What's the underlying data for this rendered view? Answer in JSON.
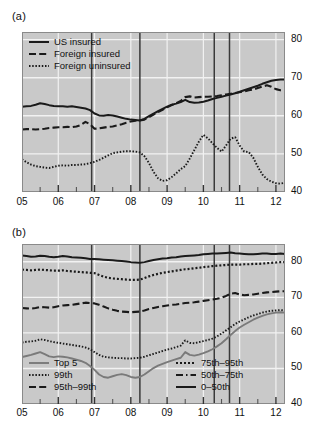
{
  "figure": {
    "width": 326,
    "height": 441,
    "background": "#ffffff",
    "plot_background": "#c9c9c9",
    "gridline_color": "#f2f2f2",
    "series_color": "#1a1a1a",
    "recession_line_color": "#3a3a3a"
  },
  "panels": [
    {
      "id": "a",
      "label": "(a)",
      "legend_position": "top-left"
    },
    {
      "id": "b",
      "label": "(b)",
      "legend_position": "bottom-split"
    }
  ],
  "chart_data": [
    {
      "type": "line",
      "panel": "a",
      "title": "(a)",
      "xlabel": "",
      "ylabel": "",
      "xlim": [
        2005.0,
        2012.25
      ],
      "ylim": [
        40,
        82
      ],
      "yticks": [
        40,
        50,
        60,
        70,
        80
      ],
      "ytick_labels": [
        "40",
        "50",
        "60",
        "70",
        "80"
      ],
      "xticks": [
        2005,
        2006,
        2007,
        2008,
        2009,
        2010,
        2011,
        2012
      ],
      "xtick_labels": [
        "05",
        "06",
        "07",
        "08",
        "09",
        "10",
        "11",
        "12"
      ],
      "xminor_ticks": [
        2005.5,
        2006.5,
        2007.5,
        2008.5,
        2009.5,
        2010.5,
        2011.5
      ],
      "grid": true,
      "grid_axis": "y",
      "legend": [
        {
          "label": "US insured",
          "style": "solid",
          "width": 2.1
        },
        {
          "label": "Foreign insured",
          "style": "dashed",
          "width": 2.1
        },
        {
          "label": "Foreign uninsured",
          "style": "dotted",
          "width": 1.8
        }
      ],
      "vertical_reference_lines": [
        2006.92,
        2008.25,
        2010.3,
        2010.72
      ],
      "x": [
        2005.0,
        2005.125,
        2005.25,
        2005.375,
        2005.5,
        2005.625,
        2005.75,
        2005.875,
        2006.0,
        2006.125,
        2006.25,
        2006.375,
        2006.5,
        2006.625,
        2006.75,
        2006.875,
        2007.0,
        2007.125,
        2007.25,
        2007.375,
        2007.5,
        2007.625,
        2007.75,
        2007.875,
        2008.0,
        2008.125,
        2008.25,
        2008.375,
        2008.5,
        2008.625,
        2008.75,
        2008.875,
        2009.0,
        2009.125,
        2009.25,
        2009.375,
        2009.5,
        2009.625,
        2009.75,
        2009.875,
        2010.0,
        2010.125,
        2010.25,
        2010.375,
        2010.5,
        2010.625,
        2010.75,
        2010.875,
        2011.0,
        2011.125,
        2011.25,
        2011.375,
        2011.5,
        2011.625,
        2011.75,
        2011.875,
        2012.0,
        2012.125,
        2012.25
      ],
      "series": [
        {
          "name": "US insured",
          "style": "solid",
          "values": [
            62.4,
            62.5,
            62.6,
            62.9,
            63.3,
            63.1,
            62.8,
            62.6,
            62.5,
            62.5,
            62.4,
            62.5,
            62.3,
            62.1,
            61.9,
            61.5,
            60.6,
            60.1,
            60.0,
            60.2,
            60.1,
            59.8,
            59.5,
            59.2,
            59.0,
            58.9,
            58.8,
            59.2,
            59.9,
            60.6,
            61.2,
            61.8,
            62.4,
            62.9,
            63.2,
            63.6,
            64.2,
            63.6,
            63.4,
            63.5,
            63.7,
            64.0,
            64.4,
            64.7,
            65.0,
            65.3,
            65.6,
            65.9,
            66.3,
            66.7,
            67.1,
            67.5,
            67.9,
            68.4,
            68.8,
            69.2,
            69.4,
            69.5,
            69.5
          ]
        },
        {
          "name": "Foreign insured",
          "style": "dashed",
          "values": [
            56.4,
            56.5,
            56.5,
            56.4,
            56.5,
            56.6,
            56.8,
            56.9,
            57.0,
            57.0,
            57.1,
            57.0,
            57.2,
            57.6,
            58.4,
            57.8,
            56.6,
            56.7,
            56.9,
            57.1,
            57.2,
            57.5,
            57.8,
            58.2,
            58.5,
            58.7,
            58.8,
            59.0,
            59.6,
            60.3,
            61.0,
            61.6,
            62.2,
            62.8,
            63.3,
            63.9,
            64.9,
            65.1,
            64.8,
            64.9,
            65.0,
            65.0,
            65.1,
            65.2,
            65.4,
            65.6,
            65.8,
            66.0,
            66.2,
            66.4,
            66.7,
            66.9,
            67.3,
            67.7,
            68.0,
            67.6,
            67.0,
            66.7,
            66.6
          ]
        },
        {
          "name": "Foreign uninsured",
          "style": "dotted",
          "values": [
            48.6,
            47.8,
            47.2,
            46.8,
            46.6,
            46.4,
            46.3,
            46.6,
            46.9,
            47.0,
            46.9,
            47.1,
            47.1,
            47.2,
            47.3,
            47.6,
            47.9,
            48.4,
            49.0,
            49.6,
            50.2,
            50.4,
            50.6,
            50.7,
            50.7,
            50.6,
            50.4,
            49.4,
            47.6,
            45.3,
            43.6,
            42.9,
            43.1,
            43.9,
            44.9,
            46.0,
            46.8,
            48.8,
            51.0,
            53.2,
            55.0,
            54.1,
            52.8,
            51.6,
            50.6,
            52.2,
            54.0,
            54.4,
            52.2,
            50.6,
            50.5,
            49.0,
            46.6,
            44.6,
            43.4,
            42.7,
            42.3,
            42.2,
            42.4
          ]
        }
      ]
    },
    {
      "type": "line",
      "panel": "b",
      "title": "(b)",
      "xlabel": "",
      "ylabel": "",
      "xlim": [
        2005.0,
        2012.25
      ],
      "ylim": [
        40,
        85
      ],
      "yticks": [
        40,
        50,
        60,
        70,
        80
      ],
      "ytick_labels": [
        "40",
        "50",
        "60",
        "70",
        "80"
      ],
      "xticks": [
        2005,
        2006,
        2007,
        2008,
        2009,
        2010,
        2011,
        2012
      ],
      "xtick_labels": [
        "05",
        "06",
        "07",
        "08",
        "09",
        "10",
        "11",
        "12"
      ],
      "xminor_ticks": [
        2005.5,
        2006.5,
        2007.5,
        2008.5,
        2009.5,
        2010.5,
        2011.5
      ],
      "grid": true,
      "grid_axis": "y",
      "legend": [
        {
          "label": "Top 5",
          "style": "solid-gray",
          "column": "left"
        },
        {
          "label": "99th",
          "style": "dotted",
          "column": "left"
        },
        {
          "label": "95th–99th",
          "style": "dashed",
          "column": "left"
        },
        {
          "label": "75th–95th",
          "style": "dotted-thick",
          "column": "right"
        },
        {
          "label": "50th–75th",
          "style": "dashdot",
          "column": "right"
        },
        {
          "label": "0–50th",
          "style": "solid",
          "column": "right"
        }
      ],
      "vertical_reference_lines": [
        2006.92,
        2008.25,
        2010.3,
        2010.72
      ],
      "x": [
        2005.0,
        2005.125,
        2005.25,
        2005.375,
        2005.5,
        2005.625,
        2005.75,
        2005.875,
        2006.0,
        2006.125,
        2006.25,
        2006.375,
        2006.5,
        2006.625,
        2006.75,
        2006.875,
        2007.0,
        2007.125,
        2007.25,
        2007.375,
        2007.5,
        2007.625,
        2007.75,
        2007.875,
        2008.0,
        2008.125,
        2008.25,
        2008.375,
        2008.5,
        2008.625,
        2008.75,
        2008.875,
        2009.0,
        2009.125,
        2009.25,
        2009.375,
        2009.5,
        2009.625,
        2009.75,
        2009.875,
        2010.0,
        2010.125,
        2010.25,
        2010.375,
        2010.5,
        2010.625,
        2010.75,
        2010.875,
        2011.0,
        2011.125,
        2011.25,
        2011.375,
        2011.5,
        2011.625,
        2011.75,
        2011.875,
        2012.0,
        2012.125,
        2012.25
      ],
      "series": [
        {
          "name": "0–50th",
          "style": "solid",
          "values": [
            81.8,
            81.6,
            81.4,
            81.5,
            81.7,
            81.6,
            81.4,
            81.3,
            81.4,
            81.6,
            81.5,
            81.3,
            81.2,
            81.1,
            81.0,
            80.8,
            80.8,
            80.7,
            80.6,
            80.5,
            80.4,
            80.3,
            80.2,
            80.1,
            79.9,
            79.8,
            79.7,
            79.9,
            80.2,
            80.5,
            80.7,
            80.9,
            81.0,
            81.2,
            81.3,
            81.5,
            81.6,
            81.7,
            81.8,
            81.9,
            82.1,
            82.2,
            82.3,
            82.3,
            82.4,
            82.5,
            82.6,
            82.4,
            82.3,
            82.2,
            82.1,
            82.1,
            82.2,
            82.3,
            82.3,
            82.2,
            82.2,
            82.3,
            82.2
          ]
        },
        {
          "name": "75th–95th",
          "style": "dotted-thick",
          "values": [
            77.8,
            77.7,
            77.6,
            77.7,
            77.8,
            77.7,
            77.6,
            77.5,
            77.5,
            77.6,
            77.4,
            77.3,
            77.2,
            77.1,
            77.0,
            76.9,
            76.8,
            76.3,
            75.8,
            75.5,
            75.3,
            75.2,
            75.1,
            75.0,
            74.9,
            74.9,
            75.0,
            75.4,
            75.9,
            76.3,
            76.6,
            76.9,
            77.1,
            77.3,
            77.5,
            77.7,
            77.9,
            78.0,
            78.2,
            78.3,
            78.5,
            78.6,
            78.8,
            78.9,
            79.0,
            79.1,
            79.2,
            79.2,
            79.2,
            79.3,
            79.3,
            79.4,
            79.4,
            79.5,
            79.6,
            79.7,
            79.8,
            79.9,
            79.9
          ]
        },
        {
          "name": "95th–99th",
          "style": "dashed",
          "values": [
            67.0,
            66.9,
            66.8,
            67.0,
            67.3,
            67.2,
            67.1,
            67.2,
            67.5,
            67.7,
            67.8,
            67.9,
            68.1,
            68.3,
            68.5,
            68.4,
            68.3,
            67.9,
            67.4,
            66.9,
            66.5,
            66.2,
            66.0,
            65.9,
            65.8,
            65.9,
            66.0,
            66.3,
            66.7,
            67.0,
            67.3,
            67.5,
            67.7,
            67.9,
            68.0,
            68.2,
            68.4,
            68.5,
            68.6,
            68.8,
            69.0,
            69.2,
            69.4,
            69.6,
            69.9,
            70.4,
            71.0,
            71.2,
            70.8,
            70.6,
            70.7,
            70.8,
            71.0,
            71.2,
            71.4,
            71.5,
            71.6,
            71.7,
            71.7
          ]
        },
        {
          "name": "99th",
          "style": "dotted",
          "values": [
            57.3,
            57.5,
            57.6,
            57.8,
            58.2,
            58.0,
            57.7,
            57.4,
            57.2,
            57.0,
            56.8,
            56.6,
            56.4,
            56.2,
            55.9,
            55.4,
            54.6,
            53.8,
            53.3,
            53.1,
            53.0,
            52.9,
            52.9,
            52.8,
            52.8,
            52.9,
            53.0,
            53.3,
            53.7,
            54.1,
            54.5,
            54.9,
            55.3,
            55.6,
            56.0,
            56.4,
            57.9,
            57.2,
            57.1,
            57.4,
            57.7,
            58.0,
            58.4,
            59.0,
            59.8,
            60.7,
            61.6,
            62.5,
            63.2,
            63.8,
            64.4,
            64.9,
            65.3,
            65.7,
            66.0,
            66.2,
            66.3,
            66.4,
            66.3
          ]
        },
        {
          "name": "Top 5",
          "style": "solid-gray",
          "values": [
            53.2,
            53.5,
            53.8,
            54.2,
            54.6,
            54.0,
            53.4,
            53.2,
            53.4,
            53.3,
            53.1,
            52.8,
            52.5,
            52.1,
            51.6,
            50.7,
            49.6,
            48.3,
            47.6,
            47.4,
            47.8,
            48.2,
            48.4,
            48.1,
            47.6,
            47.4,
            47.6,
            48.3,
            49.2,
            50.1,
            50.8,
            51.3,
            51.8,
            52.2,
            52.6,
            53.0,
            54.6,
            53.8,
            53.6,
            53.9,
            54.3,
            54.8,
            55.4,
            56.2,
            57.1,
            58.2,
            59.4,
            60.5,
            61.5,
            62.3,
            63.0,
            63.7,
            64.3,
            64.8,
            65.2,
            65.5,
            65.7,
            65.8,
            65.7
          ]
        }
      ]
    }
  ]
}
